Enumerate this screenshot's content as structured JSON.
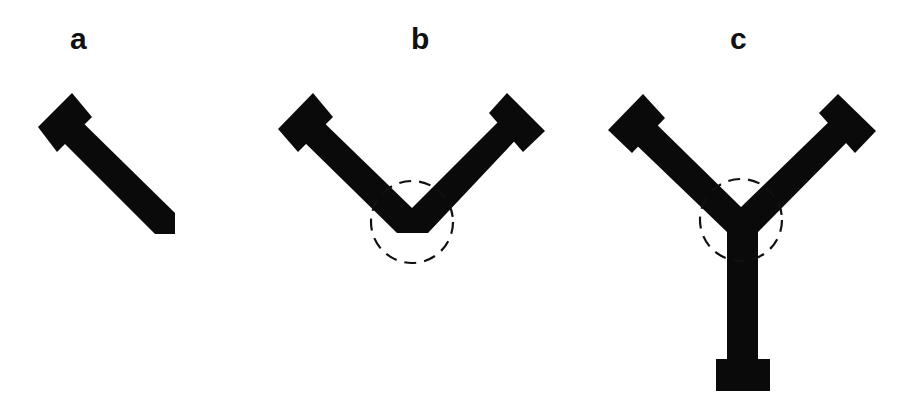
{
  "figure": {
    "panels": [
      {
        "id": "a",
        "label": "a",
        "description": "single arm segment with square head"
      },
      {
        "id": "b",
        "label": "b",
        "description": "two arms joined in a V with dashed junction circle"
      },
      {
        "id": "c",
        "label": "c",
        "description": "Y-junction of three arms with dashed junction circle"
      }
    ],
    "colors": {
      "fill": "#0a0a0a",
      "dash": "#111111",
      "background": "#ffffff"
    }
  }
}
